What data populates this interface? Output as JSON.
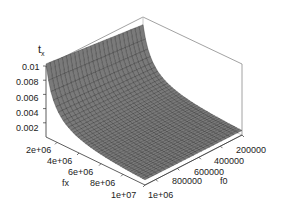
{
  "chart_data": {
    "type": "surface3d",
    "title": "",
    "zlabel": "t",
    "zlabel_subscript": "x",
    "xlabel": "fx",
    "ylabel": "f0",
    "x_ticks": [
      "2e+06",
      "4e+06",
      "6e+06",
      "8e+06",
      "1e+07"
    ],
    "y_ticks": [
      "200000",
      "400000",
      "600000",
      "800000",
      "1e+06"
    ],
    "z_ticks": [
      "0.002",
      "0.004",
      "0.006",
      "0.008",
      "0.01"
    ],
    "x_range": [
      1000000,
      10000000
    ],
    "y_range": [
      100000,
      1000000
    ],
    "z_range": [
      0,
      0.01
    ],
    "surface_description": "t_x decreases inversely with fx and f0; peak ~0.01 at smallest fx and f0, approaching 0 at large values",
    "mesh_color": "#7a7a7a",
    "grid_line_color": "#2a2a2a",
    "box": true
  }
}
